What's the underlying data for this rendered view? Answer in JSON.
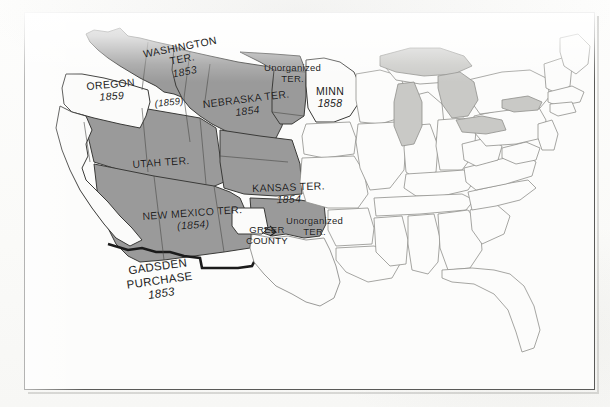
{
  "document": {
    "type": "historical-map",
    "title": "United States Territorial Map, 1850s",
    "frame_color": "#5a5a58",
    "page_background": "#fdfdfc"
  },
  "map": {
    "shaded_fill": "#9a9a9a",
    "unshaded_fill": "#fbfbfa",
    "lake_fill": "#c9c9c6",
    "border_color": "#3a3a38",
    "faint_border_color": "#8f8f8c",
    "gadsden_outline_color": "#1b1b1b",
    "legend_note": "Shaded areas denote organized territories; white areas denote states"
  },
  "labels": [
    {
      "id": "washington-territory",
      "lines": [
        "WASHINGTON",
        "TER.",
        "1853"
      ],
      "italic_lines": [
        2
      ],
      "x": 118,
      "y": 36,
      "rotate": -11,
      "size": "s11"
    },
    {
      "id": "oregon",
      "lines": [
        "OREGON",
        "1859"
      ],
      "italic_lines": [
        1
      ],
      "x": 62,
      "y": 68,
      "rotate": -5,
      "size": "s11"
    },
    {
      "id": "idaho-area-date",
      "lines": [
        "(1859)"
      ],
      "italic_lines": [
        0
      ],
      "x": 130,
      "y": 86,
      "rotate": -6,
      "size": "s10"
    },
    {
      "id": "nebraska-territory",
      "lines": [
        "NEBRASKA TER.",
        "1854"
      ],
      "italic_lines": [
        1
      ],
      "x": 178,
      "y": 86,
      "rotate": -7,
      "size": "s11"
    },
    {
      "id": "unorganized-territory-north",
      "lines": [
        "Unorganized",
        "TER."
      ],
      "italic_lines": [],
      "x": 240,
      "y": 50,
      "rotate": 0,
      "size": "s10"
    },
    {
      "id": "minnesota",
      "lines": [
        "MINN",
        "1858"
      ],
      "italic_lines": [
        1
      ],
      "x": 292,
      "y": 73,
      "rotate": 0,
      "size": "s11"
    },
    {
      "id": "utah-territory",
      "lines": [
        "UTAH TER."
      ],
      "italic_lines": [],
      "x": 108,
      "y": 146,
      "rotate": -4,
      "size": "s11"
    },
    {
      "id": "kansas-territory",
      "lines": [
        "KANSAS TER.",
        "1854"
      ],
      "italic_lines": [
        1
      ],
      "x": 228,
      "y": 170,
      "rotate": -2,
      "size": "s11"
    },
    {
      "id": "new-mexico-territory",
      "lines": [
        "NEW MEXICO TER.",
        "(1854)"
      ],
      "italic_lines": [
        1
      ],
      "x": 118,
      "y": 198,
      "rotate": -4,
      "size": "s11"
    },
    {
      "id": "greer-county",
      "lines": [
        "GREER",
        "COUNTY"
      ],
      "italic_lines": [],
      "x": 222,
      "y": 212,
      "rotate": 0,
      "size": "s10"
    },
    {
      "id": "unorganized-territory-south",
      "lines": [
        "Unorganized",
        "TER."
      ],
      "italic_lines": [],
      "x": 262,
      "y": 203,
      "rotate": 0,
      "size": "s10"
    },
    {
      "id": "gadsden-purchase",
      "lines": [
        "GADSDEN",
        "PURCHASE",
        "1853"
      ],
      "italic_lines": [
        2
      ],
      "x": 100,
      "y": 253,
      "rotate": -8,
      "size": "s12"
    }
  ]
}
